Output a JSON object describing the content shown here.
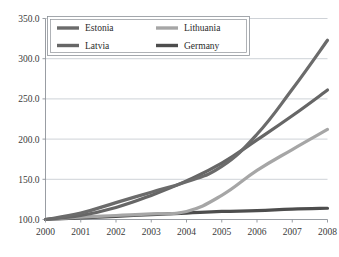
{
  "chart_data": {
    "type": "line",
    "title": "",
    "subtitle": "",
    "xlabel": "",
    "ylabel": "",
    "x": [
      2000,
      2001,
      2002,
      2003,
      2004,
      2005,
      2006,
      2007,
      2008
    ],
    "xtick_labels": [
      "2000",
      "2001",
      "2002",
      "2003",
      "2004",
      "2005",
      "2006",
      "2007",
      "2008"
    ],
    "ytick_labels": [
      "100.0",
      "150.0",
      "200.0",
      "250.0",
      "300.0",
      "350.0"
    ],
    "ytick_values": [
      100,
      150,
      200,
      250,
      300,
      350
    ],
    "ylim": [
      100,
      350
    ],
    "xlim": [
      2000,
      2008
    ],
    "grid": "horizontal",
    "legend_position": "top-inside",
    "series": [
      {
        "name": "Estonia",
        "color": "#6b6b6b",
        "values": [
          100,
          108,
          121,
          134,
          147,
          166,
          206,
          262,
          323
        ]
      },
      {
        "name": "Latvia",
        "color": "#666666",
        "values": [
          100,
          105,
          115,
          130,
          148,
          170,
          199,
          229,
          261
        ]
      },
      {
        "name": "Lithuania",
        "color": "#a6a6a6",
        "values": [
          100,
          103,
          105,
          107,
          110,
          130,
          161,
          187,
          212
        ]
      },
      {
        "name": "Germany",
        "color": "#4d4d4d",
        "values": [
          100,
          102,
          104,
          106,
          108,
          110,
          111,
          113,
          114
        ]
      }
    ]
  },
  "legend": {
    "entries": [
      {
        "label": "Estonia",
        "color": "#6b6b6b"
      },
      {
        "label": "Lithuania",
        "color": "#a6a6a6"
      },
      {
        "label": "Latvia",
        "color": "#666666"
      },
      {
        "label": "Germany",
        "color": "#4d4d4d"
      }
    ]
  },
  "colors": {
    "grid": "#b9bfc6",
    "axis": "#8d9298",
    "background": "#ffffff",
    "text": "#2b2b2b"
  }
}
